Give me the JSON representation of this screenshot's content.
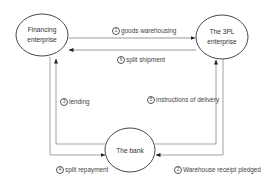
{
  "nodes": {
    "financing": {
      "label_line1": "Financing",
      "label_line2": "enterprise"
    },
    "tpl": {
      "label_line1": "The 3PL",
      "label_line2": "enterprise"
    },
    "bank": {
      "label": "The bank"
    }
  },
  "edges": [
    {
      "num": "1",
      "text": "goods warehousing",
      "from": "Financing enterprise",
      "to": "The 3PL enterprise"
    },
    {
      "num": "2",
      "text": "Warehouse receipt pledged",
      "from": "The 3PL enterprise",
      "to": "The bank"
    },
    {
      "num": "3",
      "text": "lending",
      "from": "The bank",
      "to": "Financing enterprise"
    },
    {
      "num": "4",
      "text": "split repayment",
      "from": "Financing enterprise",
      "to": "The bank"
    },
    {
      "num": "5",
      "text": "instructions of delivery",
      "from": "The bank",
      "to": "The 3PL enterprise"
    },
    {
      "num": "6",
      "text": "split shipment",
      "from": "The 3PL enterprise",
      "to": "Financing enterprise"
    }
  ],
  "colors": {
    "stroke": "#333333",
    "line": "#555555",
    "text": "#444444"
  }
}
